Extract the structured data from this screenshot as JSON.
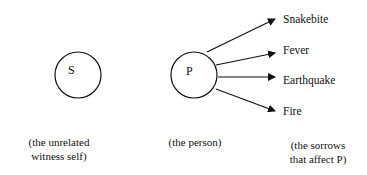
{
  "diagram": {
    "nodes": [
      {
        "id": "S",
        "letter": "S",
        "caption_line1": "(the unrelated",
        "caption_line2": "witness self)"
      },
      {
        "id": "P",
        "letter": "P",
        "caption_line1": "(the person)",
        "caption_line2": ""
      }
    ],
    "sorrows": {
      "items": [
        "Snakebite",
        "Fever",
        "Earthquake",
        "Fire"
      ],
      "caption_line1": "(the sorrows",
      "caption_line2": "that affect P)"
    }
  }
}
